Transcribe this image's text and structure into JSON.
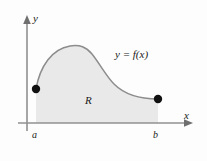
{
  "figure": {
    "type": "calculus-area-under-curve-diagram",
    "background_color": "#fdfdfd",
    "axes": {
      "y_axis_label": "y",
      "x_axis_label": "x",
      "axis_color": "#8a8a8a",
      "origin_x_px": 27,
      "origin_y_px": 123,
      "y_axis_top_px": 18,
      "y_axis_bottom_px": 131,
      "x_axis_left_px": 18,
      "x_axis_right_px": 192
    },
    "curve": {
      "label": "y = f(x)",
      "color": "#8d8d8d",
      "stroke_width": 1.4,
      "start_point": {
        "x": 36,
        "y": 89
      },
      "peak_point": {
        "x": 88,
        "y": 47
      },
      "end_point": {
        "x": 158,
        "y": 99
      }
    },
    "region": {
      "label": "R",
      "fill_color": "#e9e9e9",
      "left_bound_label": "a",
      "right_bound_label": "b",
      "left_bound_x_px": 36,
      "right_bound_x_px": 158
    },
    "endpoints": {
      "dot_color": "#111111",
      "dot_radius_px": 4,
      "left_dot": {
        "x": 36,
        "y": 89
      },
      "right_dot": {
        "x": 158,
        "y": 99
      }
    }
  }
}
